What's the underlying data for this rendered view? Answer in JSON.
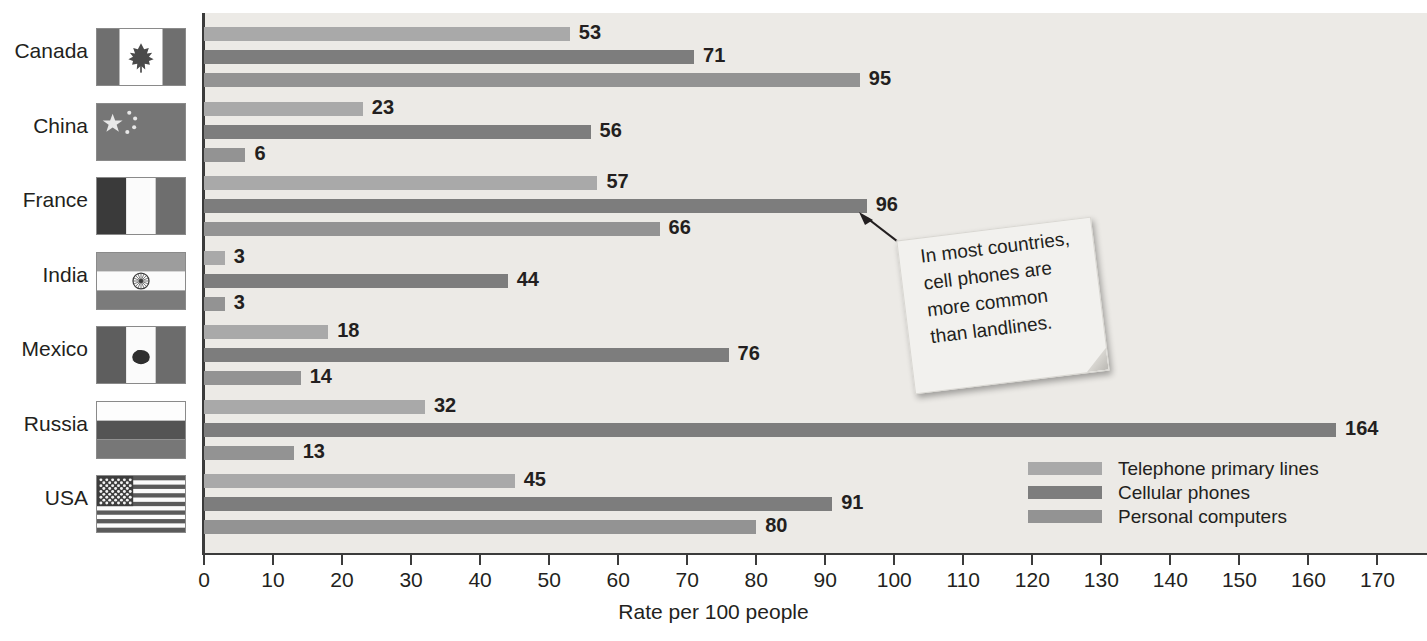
{
  "chart_data": {
    "type": "bar",
    "orientation": "horizontal",
    "title": "",
    "xlabel": "Rate per 100 people",
    "ylabel": "",
    "xlim": [
      0,
      170
    ],
    "xticks": [
      0,
      10,
      20,
      30,
      40,
      50,
      60,
      70,
      80,
      90,
      100,
      110,
      120,
      130,
      140,
      150,
      160,
      170
    ],
    "grid": false,
    "legend_position": "bottom-right",
    "categories": [
      "Canada",
      "China",
      "France",
      "India",
      "Mexico",
      "Russia",
      "USA"
    ],
    "series": [
      {
        "name": "Telephone primary lines",
        "color": "#a9a9a9",
        "values": [
          53,
          23,
          57,
          3,
          18,
          32,
          45
        ]
      },
      {
        "name": "Cellular phones",
        "color": "#7d7d7d",
        "values": [
          71,
          56,
          96,
          44,
          76,
          164,
          91
        ]
      },
      {
        "name": "Personal computers",
        "color": "#939393",
        "values": [
          95,
          6,
          66,
          3,
          14,
          13,
          80
        ]
      }
    ],
    "annotations": [
      {
        "text": "In most countries, cell phones are more common than landlines.",
        "points_to": {
          "category": "France",
          "series": "Cellular phones",
          "value": 96
        }
      }
    ]
  },
  "axis": {
    "title": "Rate per 100 people",
    "ticks": [
      "0",
      "10",
      "20",
      "30",
      "40",
      "50",
      "60",
      "70",
      "80",
      "90",
      "100",
      "110",
      "120",
      "130",
      "140",
      "150",
      "160",
      "170"
    ]
  },
  "countries": [
    {
      "name": "Canada",
      "flag": "flag-canada"
    },
    {
      "name": "China",
      "flag": "flag-china"
    },
    {
      "name": "France",
      "flag": "flag-france"
    },
    {
      "name": "India",
      "flag": "flag-india"
    },
    {
      "name": "Mexico",
      "flag": "flag-mexico"
    },
    {
      "name": "Russia",
      "flag": "flag-russia"
    },
    {
      "name": "USA",
      "flag": "flag-usa"
    }
  ],
  "legend": {
    "items": [
      {
        "label": "Telephone primary lines",
        "color": "#a9a9a9"
      },
      {
        "label": "Cellular phones",
        "color": "#7d7d7d"
      },
      {
        "label": "Personal computers",
        "color": "#939393"
      }
    ]
  },
  "callout": {
    "line1": "In most countries,",
    "line2": "cell phones are",
    "line3": "more common",
    "line4": "than landlines."
  },
  "colors": {
    "plot_background": "#eceae6",
    "axis": "#3b3b3b",
    "text": "#231f20"
  }
}
